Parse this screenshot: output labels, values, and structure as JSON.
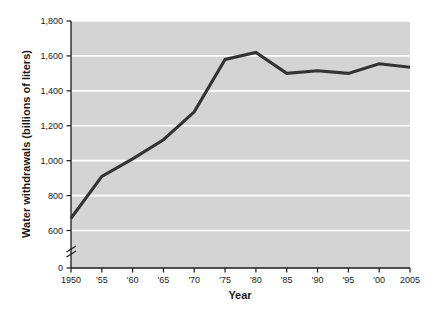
{
  "chart_data": {
    "type": "line",
    "title": "",
    "xlabel": "Year",
    "ylabel": "Water withdrawals (billions of liters)",
    "x": [
      1950,
      1955,
      1960,
      1965,
      1970,
      1975,
      1980,
      1985,
      1990,
      1995,
      2000,
      2005
    ],
    "xtick_labels": [
      "1950",
      "'55",
      "'60",
      "'65",
      "'70",
      "'75",
      "'80",
      "'85",
      "'90",
      "'95",
      "'00",
      "2005"
    ],
    "values": [
      670,
      910,
      1010,
      1120,
      1280,
      1580,
      1620,
      1500,
      1515,
      1500,
      1555,
      1535
    ],
    "ytick_labels": [
      "0",
      "600",
      "800",
      "1,000",
      "1,200",
      "1,400",
      "1,600",
      "1,800"
    ],
    "ytick_values": [
      0,
      600,
      800,
      1000,
      1200,
      1400,
      1600,
      1800
    ],
    "ylim": [
      600,
      1800
    ],
    "xlim": [
      1950,
      2005
    ],
    "axis_break": true,
    "axis_break_label": "y-axis-break",
    "grid": true,
    "grid_color": "#ffffff",
    "plot_background": "#d4d4d4",
    "line_color": "#333333",
    "axis_color": "#1a1a1a",
    "legend": []
  }
}
